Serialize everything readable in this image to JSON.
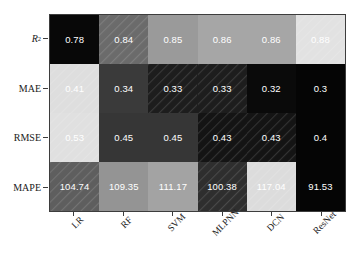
{
  "chart_data": {
    "type": "heatmap",
    "title": "",
    "xlabel": "",
    "ylabel": "",
    "grid": false,
    "legend": "none",
    "colormap": "grayscale",
    "normalization": "per-row",
    "categories": [
      "LR",
      "RF",
      "SVM",
      "MLPNN",
      "DCN",
      "ResNet"
    ],
    "rows": [
      "R²",
      "MAE",
      "RMSE",
      "MAPE"
    ],
    "series": [
      {
        "name": "R²",
        "values": [
          0.78,
          0.84,
          0.85,
          0.86,
          0.86,
          0.88
        ]
      },
      {
        "name": "MAE",
        "values": [
          0.41,
          0.34,
          0.33,
          0.33,
          0.32,
          0.3
        ]
      },
      {
        "name": "RMSE",
        "values": [
          0.53,
          0.45,
          0.45,
          0.43,
          0.43,
          0.4
        ]
      },
      {
        "name": "MAPE",
        "values": [
          104.74,
          109.35,
          111.17,
          100.38,
          117.04,
          91.53
        ]
      }
    ]
  },
  "axes": {
    "y": [
      {
        "label": "R",
        "sup": "2",
        "italic": true
      },
      {
        "label": "MAE",
        "sup": "",
        "italic": false
      },
      {
        "label": "RMSE",
        "sup": "",
        "italic": false
      },
      {
        "label": "MAPE",
        "sup": "",
        "italic": false
      }
    ],
    "x": [
      "LR",
      "RF",
      "SVM",
      "MLPNN",
      "DCN",
      "ResNet"
    ]
  },
  "cells": [
    [
      {
        "text": "0.78",
        "color": "#080808",
        "hatch": false
      },
      {
        "text": "0.84",
        "color": "#6b6b6b",
        "hatch": true
      },
      {
        "text": "0.85",
        "color": "#9a9a9a",
        "hatch": false
      },
      {
        "text": "0.86",
        "color": "#a6a6a6",
        "hatch": false
      },
      {
        "text": "0.86",
        "color": "#a6a6a6",
        "hatch": false
      },
      {
        "text": "0.88",
        "color": "#e2e2e2",
        "hatch": true
      }
    ],
    [
      {
        "text": "0.41",
        "color": "#dedede",
        "hatch": true
      },
      {
        "text": "0.34",
        "color": "#3a3a3a",
        "hatch": false
      },
      {
        "text": "0.33",
        "color": "#1d1d1d",
        "hatch": true
      },
      {
        "text": "0.33",
        "color": "#1d1d1d",
        "hatch": true
      },
      {
        "text": "0.32",
        "color": "#0a0a0a",
        "hatch": false
      },
      {
        "text": "0.3",
        "color": "#050505",
        "hatch": false
      }
    ],
    [
      {
        "text": "0.53",
        "color": "#e0e0e0",
        "hatch": true
      },
      {
        "text": "0.45",
        "color": "#363636",
        "hatch": false
      },
      {
        "text": "0.45",
        "color": "#363636",
        "hatch": false
      },
      {
        "text": "0.43",
        "color": "#141414",
        "hatch": true
      },
      {
        "text": "0.43",
        "color": "#141414",
        "hatch": true
      },
      {
        "text": "0.4",
        "color": "#050505",
        "hatch": false
      }
    ],
    [
      {
        "text": "104.74",
        "color": "#5e5e5e",
        "hatch": true
      },
      {
        "text": "109.35",
        "color": "#949494",
        "hatch": false
      },
      {
        "text": "111.17",
        "color": "#a3a3a3",
        "hatch": false
      },
      {
        "text": "100.38",
        "color": "#2e2e2e",
        "hatch": true
      },
      {
        "text": "117.04",
        "color": "#dcdcdc",
        "hatch": true
      },
      {
        "text": "91.53",
        "color": "#050505",
        "hatch": false
      }
    ]
  ]
}
